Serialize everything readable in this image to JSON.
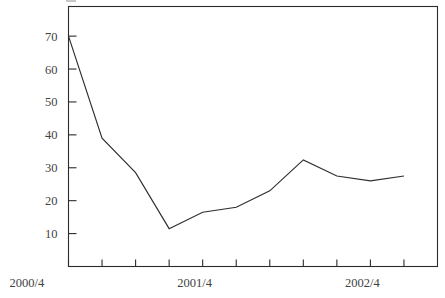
{
  "chart_data": {
    "type": "line",
    "title": "",
    "subtitle": "",
    "xlabel": "",
    "ylabel": "",
    "grid": false,
    "legend": false,
    "legend_position": "none",
    "x": [
      0,
      1,
      2,
      3,
      4,
      5,
      6,
      7,
      8,
      9,
      10
    ],
    "categories": [
      "2000/4",
      "",
      "",
      "",
      "",
      "2001/4",
      "",
      "",
      "",
      "",
      "2002/4"
    ],
    "xtick_labels": [
      "2000/4",
      "2001/4",
      "2002/4"
    ],
    "xtick_label_positions": [
      0,
      5,
      10
    ],
    "values": [
      70.0,
      39.0,
      28.5,
      11.5,
      16.5,
      18.0,
      23.0,
      32.4,
      27.5,
      26.0,
      27.5
    ],
    "series": [
      {
        "name": "series-1",
        "values": [
          70.0,
          39.0,
          28.5,
          11.5,
          16.5,
          18.0,
          23.0,
          32.4,
          27.5,
          26.0,
          27.5
        ],
        "color": "#2e2e2e"
      }
    ],
    "ylim": [
      0,
      79
    ],
    "ytick_values": [
      10,
      20,
      30,
      40,
      50,
      60,
      70
    ],
    "ytick_labels": [
      "10",
      "20",
      "30",
      "40",
      "50",
      "60",
      "70"
    ],
    "xlim": [
      0,
      11
    ],
    "xtick_count": 11,
    "axis_color": "#2b2b2b",
    "line_color": "#2e2e2e",
    "background_color": "#ffffff"
  },
  "axes": {
    "y_axis_name": "y-axis",
    "x_axis_name": "x-axis"
  }
}
